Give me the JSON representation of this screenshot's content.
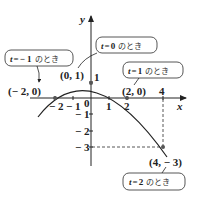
{
  "figure": {
    "type": "parametric-curve-graph",
    "curve": "y = 1 - x^2/4",
    "axes": {
      "x_label": "x",
      "y_label": "y",
      "origin_label": "0",
      "x_ticks": [
        {
          "value": -2,
          "label": "− 2"
        },
        {
          "value": -1,
          "label": "− 1"
        },
        {
          "value": 1,
          "label": "1"
        },
        {
          "value": 2,
          "label": "2"
        },
        {
          "value": 4,
          "label": "4"
        }
      ],
      "y_ticks": [
        {
          "value": 1,
          "label": "1"
        },
        {
          "value": -1,
          "label": "− 1"
        },
        {
          "value": -2,
          "label": "− 2"
        },
        {
          "value": -3,
          "label": "− 3"
        }
      ]
    },
    "points": [
      {
        "x": -2,
        "y": 0,
        "label": "(− 2,  0)"
      },
      {
        "x": 0,
        "y": 1,
        "label": "(0,  1)"
      },
      {
        "x": 2,
        "y": 0,
        "label": "(2,  0)"
      },
      {
        "x": 4,
        "y": -3,
        "label": "(4,  − 3)"
      }
    ],
    "callouts": [
      {
        "t_var": "t",
        "eq": "=",
        "t_value": "− 1",
        "suffix": "のとき"
      },
      {
        "t_var": "t",
        "eq": "=",
        "t_value": "0",
        "suffix": "のとき"
      },
      {
        "t_var": "t",
        "eq": "=",
        "t_value": "1",
        "suffix": "のとき"
      },
      {
        "t_var": "t",
        "eq": "=",
        "t_value": "2",
        "suffix": "のとき"
      }
    ],
    "colors": {
      "line": "#222222",
      "dash": "#444444",
      "box_border": "#444444",
      "point": "#555555"
    }
  }
}
